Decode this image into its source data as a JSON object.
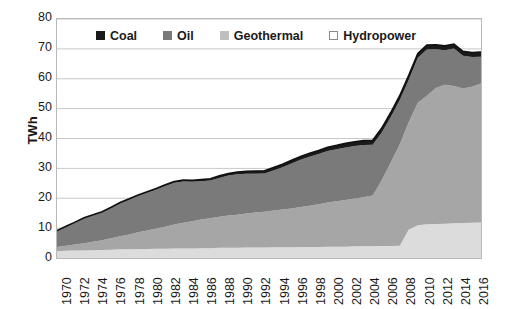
{
  "chart_data": {
    "type": "area",
    "stacked": true,
    "title": "",
    "subtitle": "",
    "xlabel": "",
    "ylabel": "TWh",
    "ylim": [
      0,
      80
    ],
    "yticks": [
      0,
      10,
      20,
      30,
      40,
      50,
      60,
      70,
      80
    ],
    "grid": true,
    "legend_position": "top-inside",
    "xlim": [
      1970,
      2017
    ],
    "xticks": [
      1970,
      1972,
      1974,
      1976,
      1978,
      1980,
      1982,
      1984,
      1986,
      1988,
      1990,
      1992,
      1994,
      1996,
      1998,
      2000,
      2002,
      2004,
      2006,
      2008,
      2010,
      2012,
      2014,
      2016
    ],
    "x": [
      1970,
      1971,
      1972,
      1973,
      1974,
      1975,
      1976,
      1977,
      1978,
      1979,
      1980,
      1981,
      1982,
      1983,
      1984,
      1985,
      1986,
      1987,
      1988,
      1989,
      1990,
      1991,
      1992,
      1993,
      1994,
      1995,
      1996,
      1997,
      1998,
      1999,
      2000,
      2001,
      2002,
      2003,
      2004,
      2005,
      2006,
      2007,
      2008,
      2009,
      2010,
      2011,
      2012,
      2013,
      2014,
      2015,
      2016,
      2017
    ],
    "series": [
      {
        "name": "Hydropower",
        "color": "#dcdcdc",
        "stack_order": 1,
        "values": [
          2.3,
          2.4,
          2.5,
          2.5,
          2.6,
          2.7,
          2.8,
          2.9,
          2.9,
          3.0,
          3.0,
          3.1,
          3.1,
          3.2,
          3.2,
          3.2,
          3.3,
          3.3,
          3.4,
          3.4,
          3.4,
          3.5,
          3.5,
          3.5,
          3.6,
          3.6,
          3.6,
          3.7,
          3.7,
          3.7,
          3.8,
          3.8,
          3.8,
          3.9,
          3.9,
          3.9,
          4.0,
          4.0,
          4.1,
          9.5,
          11.0,
          11.3,
          11.4,
          11.5,
          11.6,
          11.7,
          11.8,
          11.9
        ]
      },
      {
        "name": "Geothermal",
        "color": "#a6a6a6",
        "stack_order": 2,
        "values": [
          1.4,
          1.7,
          2.0,
          2.4,
          2.8,
          3.2,
          3.8,
          4.4,
          5.0,
          5.6,
          6.2,
          6.8,
          7.4,
          8.0,
          8.6,
          9.1,
          9.6,
          10.0,
          10.4,
          10.8,
          11.1,
          11.4,
          11.7,
          12.0,
          12.3,
          12.6,
          13.0,
          13.4,
          13.8,
          14.3,
          14.8,
          15.2,
          15.6,
          16.0,
          16.4,
          17.0,
          22.0,
          28.0,
          34.0,
          36.0,
          41.0,
          43.0,
          45.5,
          46.5,
          46.0,
          45.0,
          45.5,
          46.5
        ]
      },
      {
        "name": "Oil",
        "color": "#7a7a7a",
        "stack_order": 3,
        "values": [
          5.3,
          6.3,
          7.3,
          8.4,
          8.9,
          9.4,
          10.2,
          11.0,
          11.6,
          12.2,
          12.7,
          13.0,
          13.6,
          14.0,
          13.8,
          13.2,
          12.8,
          12.6,
          13.0,
          13.4,
          13.5,
          13.3,
          13.0,
          12.8,
          13.4,
          14.2,
          15.0,
          15.8,
          16.4,
          16.8,
          17.2,
          17.4,
          17.6,
          17.6,
          17.5,
          17.0,
          16.0,
          15.2,
          14.8,
          14.2,
          15.0,
          15.5,
          13.0,
          11.5,
          12.5,
          11.0,
          10.0,
          9.0
        ]
      },
      {
        "name": "Coal",
        "color": "#1a1a1a",
        "stack_order": 4,
        "values": [
          0.2,
          0.2,
          0.2,
          0.2,
          0.2,
          0.2,
          0.2,
          0.3,
          0.3,
          0.3,
          0.3,
          0.4,
          0.4,
          0.4,
          0.5,
          0.5,
          0.6,
          0.6,
          0.7,
          0.7,
          0.8,
          0.8,
          0.9,
          0.9,
          1.0,
          1.0,
          1.1,
          1.1,
          1.2,
          1.2,
          1.3,
          1.3,
          1.4,
          1.4,
          1.5,
          1.5,
          1.5,
          1.5,
          1.5,
          1.5,
          1.5,
          1.5,
          1.5,
          1.5,
          1.5,
          1.5,
          1.5,
          1.5
        ]
      }
    ],
    "legend": [
      {
        "label": "Coal",
        "color": "#1a1a1a",
        "swatch_border": "#1a1a1a"
      },
      {
        "label": "Oil",
        "color": "#7a7a7a",
        "swatch_border": "#7a7a7a"
      },
      {
        "label": "Geothermal",
        "color": "#bfbfbf",
        "swatch_border": "#bfbfbf"
      },
      {
        "label": "Hydropower",
        "color": "#ffffff",
        "swatch_border": "#8a8a8a"
      }
    ]
  },
  "axes": {
    "y_title": "TWh",
    "y_tick_labels": [
      "80",
      "70",
      "60",
      "50",
      "40",
      "30",
      "20",
      "10",
      "0"
    ],
    "x_tick_labels": [
      "1970",
      "1972",
      "1974",
      "1976",
      "1978",
      "1980",
      "1982",
      "1984",
      "1986",
      "1988",
      "1990",
      "1992",
      "1994",
      "1996",
      "1998",
      "2000",
      "2002",
      "2004",
      "2006",
      "2008",
      "2010",
      "2012",
      "2014",
      "2016"
    ]
  },
  "style": {
    "grid_color": "#c8c8c8",
    "frame_color": "#b9b9b9",
    "text_color": "#1a1a1a",
    "background": "#ffffff"
  }
}
